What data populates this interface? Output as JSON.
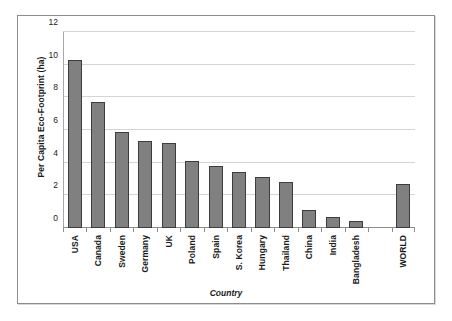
{
  "chart_data": {
    "type": "bar",
    "title": "",
    "xlabel": "Country",
    "ylabel": "Per Capita Eco-Footprint (ha)",
    "categories": [
      "USA",
      "Canada",
      "Sweden",
      "Germany",
      "UK",
      "Poland",
      "Spain",
      "S. Korea",
      "Hungary",
      "Thailand",
      "China",
      "India",
      "Bangladesh",
      "",
      "WORLD"
    ],
    "values": [
      10.3,
      7.7,
      5.9,
      5.3,
      5.2,
      4.1,
      3.8,
      3.4,
      3.1,
      2.8,
      1.1,
      0.7,
      0.4,
      null,
      2.7
    ],
    "ylim": [
      0,
      12
    ],
    "yticks": [
      0,
      2,
      4,
      6,
      8,
      10,
      12
    ],
    "ytick_labels": [
      "0",
      "2",
      "4",
      "6",
      "8",
      "10",
      "12"
    ],
    "grid": true,
    "legend": false,
    "bar_color": "#808080",
    "bar_border_color": "#3d3d3d",
    "gridline_color": "#d4d4d4",
    "frame_color": "#8d8d8d"
  }
}
